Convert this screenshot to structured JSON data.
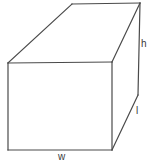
{
  "figure": {
    "name": "rectangular-prism-diagram",
    "shape": "rectangular prism",
    "background_color": "#ffffff",
    "line_color": "#4a4a4a",
    "face_color": "#ffffff",
    "labels": {
      "height": "h",
      "length": "l",
      "width": "w"
    },
    "geometry": {
      "front_face": "8,63 112,62 112,150 8,150",
      "top_face": "8,63 72,4 140,3 112,62",
      "right_face": "112,62 140,3 138,95 112,150",
      "vertices": {
        "front_top_left": [
          8,
          63
        ],
        "front_top_right": [
          112,
          62
        ],
        "front_bottom_left": [
          8,
          150
        ],
        "front_bottom_right": [
          112,
          150
        ],
        "back_top_left": [
          72,
          4
        ],
        "back_top_right": [
          140,
          3
        ],
        "back_bottom_right": [
          138,
          95
        ]
      }
    }
  }
}
